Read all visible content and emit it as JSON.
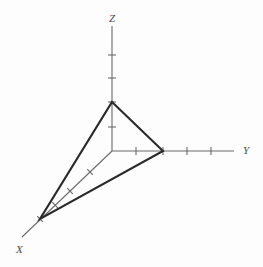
{
  "figure": {
    "kind": "3d-axes-triangle-diagram",
    "background_color": "#fdfdfd",
    "axis_color": "#6b6b6b",
    "plane_color": "#2a2a2a",
    "label_color": "#4a4a4a",
    "origin": {
      "x": 112,
      "y": 151
    }
  },
  "axes": {
    "z": {
      "label": "Z",
      "label_pos": {
        "x": 109,
        "y": 22
      },
      "start": {
        "x": 112,
        "y": 26
      },
      "end": {
        "x": 112,
        "y": 151
      },
      "tick_half_length": 4,
      "ticks": [
        {
          "x": 112,
          "y": 55
        },
        {
          "x": 112,
          "y": 78
        },
        {
          "x": 112,
          "y": 102
        },
        {
          "x": 112,
          "y": 127
        }
      ]
    },
    "y": {
      "label": "Y",
      "label_pos": {
        "x": 243,
        "y": 154
      },
      "start": {
        "x": 112,
        "y": 151
      },
      "end": {
        "x": 234,
        "y": 151
      },
      "tick_half_length": 4,
      "ticks": [
        {
          "x": 136,
          "y": 151
        },
        {
          "x": 163,
          "y": 151
        },
        {
          "x": 187,
          "y": 151
        },
        {
          "x": 211,
          "y": 151
        }
      ]
    },
    "x": {
      "label": "X",
      "label_pos": {
        "x": 16,
        "y": 253
      },
      "start": {
        "x": 112,
        "y": 151
      },
      "end": {
        "x": 22,
        "y": 237
      },
      "tick_half_length": 4,
      "ticks": [
        {
          "x": 90,
          "y": 172
        },
        {
          "x": 70,
          "y": 191
        },
        {
          "x": 55,
          "y": 205
        },
        {
          "x": 40,
          "y": 219
        }
      ]
    }
  },
  "plane_triangle": {
    "name": "intercept-triangle",
    "vertices": [
      {
        "axis": "Z",
        "x": 112,
        "y": 102
      },
      {
        "axis": "Y",
        "x": 163,
        "y": 151
      },
      {
        "axis": "X",
        "x": 40,
        "y": 219
      }
    ]
  }
}
